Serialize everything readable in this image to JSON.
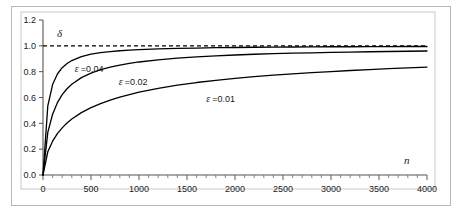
{
  "chart_data": {
    "type": "line",
    "title": "",
    "subtitle": "",
    "xlabel": "n",
    "ylabel": "δ",
    "xlim": [
      0,
      4000
    ],
    "ylim": [
      0.0,
      1.2
    ],
    "grid": false,
    "legend_position": "inline-annotations",
    "x_ticks": [
      0,
      500,
      1000,
      1500,
      2000,
      2500,
      3000,
      3500,
      4000
    ],
    "x_tick_labels": [
      "0",
      "500",
      "1000",
      "1500",
      "2000",
      "2500",
      "3000",
      "3500",
      "4000"
    ],
    "x_minor_ticks_between": 4,
    "y_ticks": [
      0.0,
      0.2,
      0.4,
      0.6,
      0.8,
      1.0,
      1.2
    ],
    "y_tick_labels": [
      "0.0",
      "0.2",
      "0.4",
      "0.6",
      "0.8",
      "1.0",
      "1.2"
    ],
    "asymptote": {
      "value": 1.0,
      "style": "dashed",
      "color": "#000000"
    },
    "x": [
      0,
      50,
      100,
      150,
      200,
      250,
      300,
      400,
      500,
      600,
      700,
      800,
      900,
      1000,
      1200,
      1400,
      1600,
      1800,
      2000,
      2200,
      2400,
      2600,
      2800,
      3000,
      3200,
      3400,
      3600,
      3800,
      4000
    ],
    "series": [
      {
        "name": "ε=0.04",
        "label_symbol": "ε",
        "label_text": "=0.04",
        "epsilon": 0.04,
        "color": "#000000",
        "label_x": 330,
        "label_y": 0.8,
        "values": [
          0.0,
          0.535,
          0.7,
          0.782,
          0.831,
          0.863,
          0.886,
          0.917,
          0.935,
          0.947,
          0.955,
          0.962,
          0.967,
          0.971,
          0.977,
          0.98,
          0.983,
          0.986,
          0.987,
          0.989,
          0.99,
          0.991,
          0.992,
          0.993,
          0.993,
          0.994,
          0.994,
          0.995,
          0.995
        ]
      },
      {
        "name": "ε=0.02",
        "label_symbol": "ε",
        "label_text": "=0.02",
        "epsilon": 0.02,
        "color": "#000000",
        "label_x": 790,
        "label_y": 0.695,
        "values": [
          0.0,
          0.33,
          0.47,
          0.56,
          0.622,
          0.668,
          0.703,
          0.754,
          0.789,
          0.815,
          0.835,
          0.851,
          0.864,
          0.875,
          0.892,
          0.905,
          0.915,
          0.923,
          0.929,
          0.935,
          0.939,
          0.943,
          0.946,
          0.949,
          0.952,
          0.954,
          0.956,
          0.958,
          0.96
        ]
      },
      {
        "name": "ε=0.01",
        "label_symbol": "ε",
        "label_text": "=0.01",
        "epsilon": 0.01,
        "color": "#000000",
        "label_x": 1700,
        "label_y": 0.565,
        "values": [
          0.0,
          0.18,
          0.262,
          0.32,
          0.365,
          0.402,
          0.433,
          0.483,
          0.522,
          0.553,
          0.58,
          0.603,
          0.623,
          0.641,
          0.671,
          0.695,
          0.716,
          0.733,
          0.748,
          0.761,
          0.773,
          0.783,
          0.793,
          0.801,
          0.809,
          0.816,
          0.823,
          0.829,
          0.835
        ]
      }
    ]
  }
}
